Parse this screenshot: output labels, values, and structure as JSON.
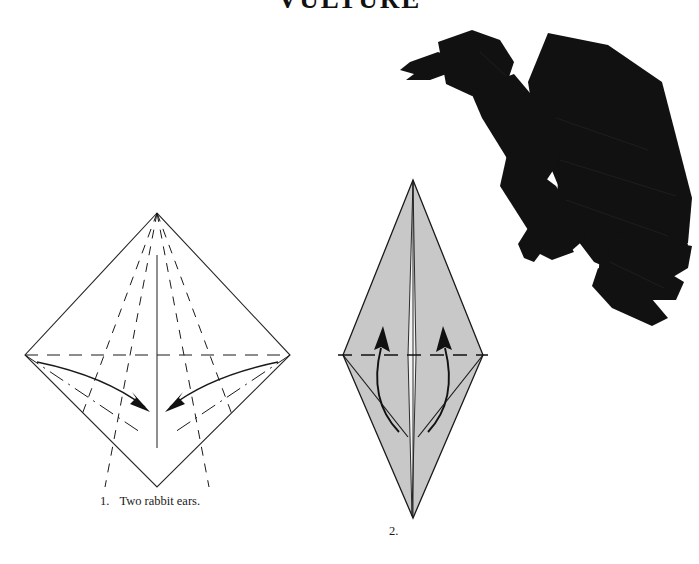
{
  "page": {
    "title": "VULTURE",
    "background_color": "#ffffff",
    "width": 699,
    "height": 564
  },
  "steps": [
    {
      "number": "1.",
      "text": "Two rabbit ears.",
      "shape": "kite-diamond",
      "fill": "#ffffff",
      "stroke": "#222222"
    },
    {
      "number": "2.",
      "text": "",
      "shape": "tall-rhombus",
      "fill": "#c8c8c8",
      "stroke": "#1a1a1a"
    }
  ],
  "model_photo": {
    "name": "origami-vulture-photo",
    "subject": "folded paper vulture",
    "color": "#111111"
  },
  "legend": {
    "valley_fold": "dashed",
    "mountain_fold": "dash-dot",
    "fold_arrow": "curved-arrow"
  }
}
